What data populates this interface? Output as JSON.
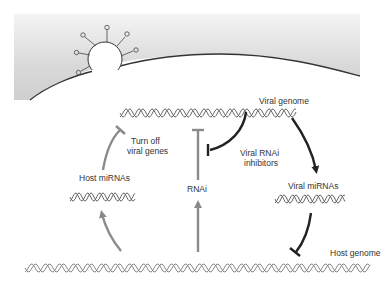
{
  "diagram": {
    "labels": {
      "viral_genome": "Viral genome",
      "turn_off_line1": "Turn off",
      "turn_off_line2": "viral genes",
      "viral_rnai_inhibitors_line1": "Viral RNAi",
      "viral_rnai_inhibitors_line2": "inhibitors",
      "host_mirnas": "Host miRNAs",
      "rnai": "RNAi",
      "viral_mirnas": "Viral miRNAs",
      "host_genome": "Host genome"
    },
    "elements": {
      "cell_membrane": "gray gradient region with curved border",
      "virus_particle": "circular virion with surface spikes budding at membrane"
    },
    "edges": [
      {
        "from": "host_genome",
        "to": "host_mirnas",
        "type": "activation",
        "color": "#8a8a8a"
      },
      {
        "from": "host_mirnas",
        "to": "viral_genome",
        "type": "inhibition",
        "label": "Turn off viral genes",
        "color": "#8a8a8a"
      },
      {
        "from": "host_genome",
        "to": "rnai",
        "type": "activation",
        "color": "#8a8a8a"
      },
      {
        "from": "rnai",
        "to": "viral_genome",
        "type": "inhibition",
        "color": "#8a8a8a"
      },
      {
        "from": "viral_genome",
        "to": "rnai",
        "type": "inhibition",
        "label": "Viral RNAi inhibitors",
        "color": "#222222"
      },
      {
        "from": "viral_genome",
        "to": "viral_mirnas",
        "type": "activation",
        "color": "#222222"
      },
      {
        "from": "viral_mirnas",
        "to": "host_genome",
        "type": "inhibition",
        "color": "#222222"
      }
    ],
    "colors": {
      "host_arrow": "#8a8a8a",
      "viral_arrow": "#222222",
      "membrane_fill": "#d6d6d6",
      "helix": "#555555"
    }
  }
}
